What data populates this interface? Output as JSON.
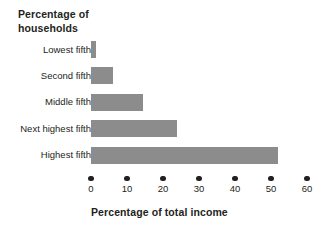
{
  "chart_data": {
    "type": "bar",
    "orientation": "horizontal",
    "title": "Percentage of\nhouseholds",
    "title_line1": "Percentage of",
    "title_line2": "households",
    "xlabel": "Percentage of total income",
    "ylabel": "",
    "categories": [
      "Lowest fifth",
      "Second fifth",
      "Middle fifth",
      "Next highest fifth",
      "Highest fifth"
    ],
    "values": [
      1.5,
      6,
      14.5,
      24,
      52
    ],
    "xlim": [
      0,
      60
    ],
    "xticks": [
      0,
      10,
      20,
      30,
      40,
      50,
      60
    ],
    "xtick_labels": [
      "0",
      "10",
      "20",
      "30",
      "40",
      "50",
      "60"
    ],
    "grid": false,
    "legend": false,
    "bar_color": "#8c8c8c",
    "text_color": "#231f20",
    "background": "#ffffff"
  }
}
